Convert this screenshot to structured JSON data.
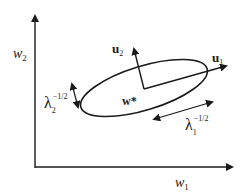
{
  "diagram": {
    "axes": {
      "x_label": "w",
      "x_sub": "1",
      "y_label": "w",
      "y_sub": "2"
    },
    "center_label": "w*",
    "eigvec1": {
      "label": "u",
      "sub": "1"
    },
    "eigvec2": {
      "label": "u",
      "sub": "2"
    },
    "scale1": {
      "symbol": "λ",
      "sub": "1",
      "sup": "−1/2"
    },
    "scale2": {
      "symbol": "λ",
      "sub": "2",
      "sup": "−1/2"
    },
    "colors": {
      "ink": "#1a1a1a",
      "background": "#ffffff"
    }
  }
}
